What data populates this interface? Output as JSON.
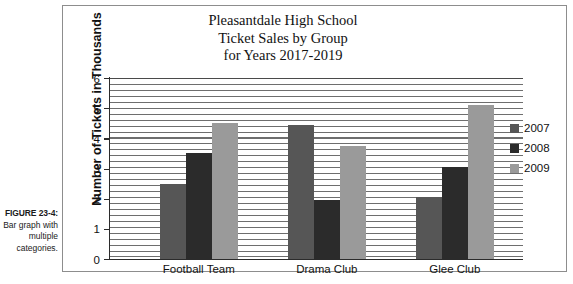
{
  "figure": {
    "label": "FIGURE 23-4:",
    "description": "Bar graph with multiple categories."
  },
  "chart_data": {
    "type": "bar",
    "title": "Pleasantdale High School Ticket Sales by Group for Years 2017-2019",
    "title_lines": [
      "Pleasantdale High School",
      "Ticket Sales by Group",
      "for Years 2017-2019"
    ],
    "xlabel": "",
    "ylabel": "Number of Tickets in Thousands",
    "ylim": [
      0,
      6
    ],
    "yticks": [
      0,
      1,
      2,
      3,
      4,
      5,
      6
    ],
    "ytick_labels": [
      "0",
      "1",
      "2",
      "3",
      "4",
      "5",
      "6"
    ],
    "grid": true,
    "grid_orientation": "horizontal",
    "legend_position": "right",
    "categories": [
      "Football Team",
      "Drama Club",
      "Glee Club"
    ],
    "series": [
      {
        "name": "2007",
        "color": "#565656",
        "values": [
          2.5,
          4.45,
          2.05
        ]
      },
      {
        "name": "2008",
        "color": "#2b2b2b",
        "values": [
          3.5,
          1.95,
          3.05
        ]
      },
      {
        "name": "2009",
        "color": "#9a9a9a",
        "values": [
          4.5,
          3.75,
          5.1
        ]
      }
    ]
  },
  "colors": {
    "frame": "#8d8d8d",
    "axis": "#2b2b2b",
    "gridline": "#6e6e6e",
    "text": "#111111",
    "background": "#ffffff"
  }
}
